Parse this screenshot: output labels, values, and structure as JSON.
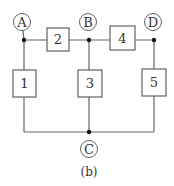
{
  "diagram": {
    "caption": "(b)",
    "nodes": [
      {
        "id": "A",
        "label": "A",
        "cx": 22,
        "cy": 22
      },
      {
        "id": "B",
        "label": "B",
        "cx": 88,
        "cy": 22
      },
      {
        "id": "D",
        "label": "D",
        "cx": 153,
        "cy": 22
      },
      {
        "id": "C",
        "label": "C",
        "cx": 89,
        "cy": 149
      }
    ],
    "elements": [
      {
        "id": "1",
        "label": "1",
        "x": 13,
        "y": 70,
        "w": 23,
        "h": 27
      },
      {
        "id": "2",
        "label": "2",
        "x": 47,
        "y": 28,
        "w": 22,
        "h": 23
      },
      {
        "id": "3",
        "label": "3",
        "x": 78,
        "y": 70,
        "w": 24,
        "h": 27
      },
      {
        "id": "4",
        "label": "4",
        "x": 110,
        "y": 26,
        "w": 25,
        "h": 24
      },
      {
        "id": "5",
        "label": "5",
        "x": 142,
        "y": 69,
        "w": 24,
        "h": 27
      }
    ],
    "connections": [
      {
        "from": "A",
        "to": "B",
        "via": "2"
      },
      {
        "from": "B",
        "to": "D",
        "via": "4"
      },
      {
        "from": "A",
        "to": "C",
        "via": "1"
      },
      {
        "from": "B",
        "to": "C",
        "via": "3"
      },
      {
        "from": "D",
        "to": "C",
        "via": "5"
      }
    ]
  }
}
